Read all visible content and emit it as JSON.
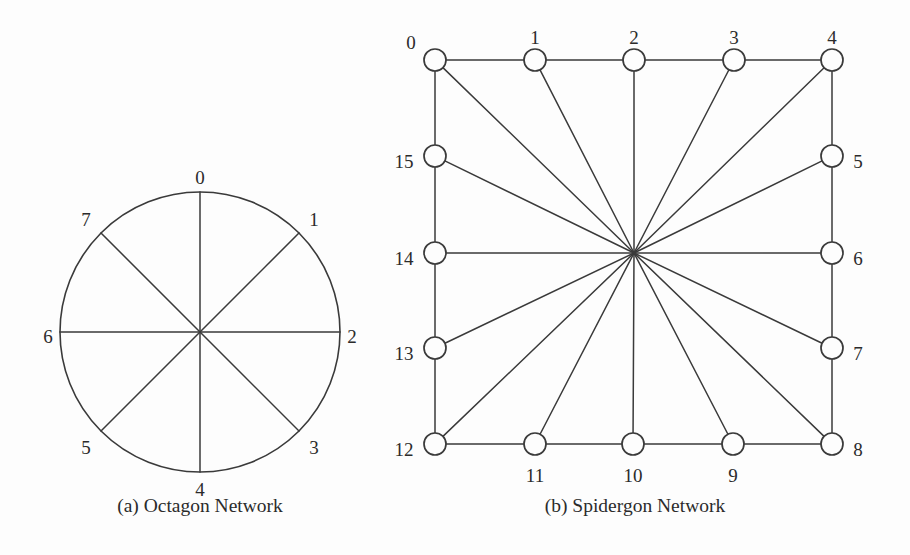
{
  "figure": {
    "background_color": "#fdfdfd",
    "line_color": "#3a3a3a",
    "text_color": "#2b2b2b",
    "panels": [
      {
        "id": "octagon",
        "caption": "(a) Octagon Network",
        "caption_x": 200,
        "caption_y": 512,
        "ring": {
          "cx": 200,
          "cy": 332,
          "r": 140
        },
        "node_count": 8,
        "nodes": [
          {
            "label": "0",
            "angle_deg": 90,
            "x": 200,
            "y": 192,
            "lx": 200,
            "ly": 180,
            "anchor": "middle"
          },
          {
            "label": "1",
            "angle_deg": 45,
            "x": 299,
            "y": 233,
            "lx": 314,
            "ly": 222,
            "anchor": "middle"
          },
          {
            "label": "2",
            "angle_deg": 0,
            "x": 340,
            "y": 332,
            "lx": 352,
            "ly": 339,
            "anchor": "middle"
          },
          {
            "label": "3",
            "angle_deg": -45,
            "x": 299,
            "y": 431,
            "lx": 314,
            "ly": 450,
            "anchor": "middle"
          },
          {
            "label": "4",
            "angle_deg": -90,
            "x": 200,
            "y": 472,
            "lx": 200,
            "ly": 492,
            "anchor": "middle"
          },
          {
            "label": "5",
            "angle_deg": -135,
            "x": 101,
            "y": 431,
            "lx": 86,
            "ly": 450,
            "anchor": "middle"
          },
          {
            "label": "6",
            "angle_deg": 180,
            "x": 60,
            "y": 332,
            "lx": 48,
            "ly": 339,
            "anchor": "middle"
          },
          {
            "label": "7",
            "angle_deg": 135,
            "x": 101,
            "y": 233,
            "lx": 86,
            "ly": 222,
            "anchor": "middle"
          }
        ],
        "diameters": [
          {
            "from": "0",
            "to": "4"
          },
          {
            "from": "1",
            "to": "5"
          },
          {
            "from": "2",
            "to": "6"
          },
          {
            "from": "3",
            "to": "7"
          }
        ]
      },
      {
        "id": "spidergon",
        "caption": "(b) Spidergon Network",
        "caption_x": 635,
        "caption_y": 512,
        "hub": {
          "x": 634,
          "y": 253
        },
        "node_radius": 11,
        "node_count": 16,
        "nodes": [
          {
            "label": "0",
            "x": 435,
            "y": 60,
            "lx": 411,
            "ly": 45,
            "anchor": "middle"
          },
          {
            "label": "1",
            "x": 535,
            "y": 60,
            "lx": 535,
            "ly": 40,
            "anchor": "middle"
          },
          {
            "label": "2",
            "x": 634,
            "y": 60,
            "lx": 634,
            "ly": 40,
            "anchor": "middle"
          },
          {
            "label": "3",
            "x": 734,
            "y": 60,
            "lx": 734,
            "ly": 40,
            "anchor": "middle"
          },
          {
            "label": "4",
            "x": 832,
            "y": 60,
            "lx": 832,
            "ly": 40,
            "anchor": "middle"
          },
          {
            "label": "5",
            "x": 832,
            "y": 156,
            "lx": 858,
            "ly": 164,
            "anchor": "middle"
          },
          {
            "label": "6",
            "x": 832,
            "y": 253,
            "lx": 858,
            "ly": 261,
            "anchor": "middle"
          },
          {
            "label": "7",
            "x": 832,
            "y": 348,
            "lx": 858,
            "ly": 356,
            "anchor": "middle"
          },
          {
            "label": "8",
            "x": 832,
            "y": 444,
            "lx": 858,
            "ly": 452,
            "anchor": "middle"
          },
          {
            "label": "9",
            "x": 733,
            "y": 444,
            "lx": 733,
            "ly": 478,
            "anchor": "middle"
          },
          {
            "label": "10",
            "x": 633,
            "y": 444,
            "lx": 633,
            "ly": 478,
            "anchor": "middle"
          },
          {
            "label": "11",
            "x": 535,
            "y": 444,
            "lx": 535,
            "ly": 478,
            "anchor": "middle"
          },
          {
            "label": "12",
            "x": 435,
            "y": 444,
            "lx": 404,
            "ly": 452,
            "anchor": "middle"
          },
          {
            "label": "13",
            "x": 435,
            "y": 348,
            "lx": 404,
            "ly": 356,
            "anchor": "middle"
          },
          {
            "label": "14",
            "x": 435,
            "y": 253,
            "lx": 404,
            "ly": 261,
            "anchor": "middle"
          },
          {
            "label": "15",
            "x": 435,
            "y": 156,
            "lx": 404,
            "ly": 164,
            "anchor": "middle"
          }
        ],
        "ring_edges": [
          [
            "0",
            "1"
          ],
          [
            "1",
            "2"
          ],
          [
            "2",
            "3"
          ],
          [
            "3",
            "4"
          ],
          [
            "4",
            "5"
          ],
          [
            "5",
            "6"
          ],
          [
            "6",
            "7"
          ],
          [
            "7",
            "8"
          ],
          [
            "8",
            "9"
          ],
          [
            "9",
            "10"
          ],
          [
            "10",
            "11"
          ],
          [
            "11",
            "12"
          ],
          [
            "12",
            "13"
          ],
          [
            "13",
            "14"
          ],
          [
            "14",
            "15"
          ],
          [
            "15",
            "0"
          ]
        ],
        "cross_edges": [
          [
            "0",
            "8"
          ],
          [
            "1",
            "9"
          ],
          [
            "2",
            "10"
          ],
          [
            "3",
            "11"
          ],
          [
            "4",
            "12"
          ],
          [
            "5",
            "13"
          ],
          [
            "6",
            "14"
          ],
          [
            "7",
            "15"
          ]
        ]
      }
    ]
  },
  "chart_data": {
    "type": "diagram",
    "subfigures": [
      {
        "label": "(a) Octagon Network",
        "node_labels": [
          "0",
          "1",
          "2",
          "3",
          "4",
          "5",
          "6",
          "7"
        ],
        "layout": "circle",
        "edges": "8 ring nodes on circle with 4 cross diameters (0-4, 1-5, 2-6, 3-7)"
      },
      {
        "label": "(b) Spidergon Network",
        "node_labels": [
          "0",
          "1",
          "2",
          "3",
          "4",
          "5",
          "6",
          "7",
          "8",
          "9",
          "10",
          "11",
          "12",
          "13",
          "14",
          "15"
        ],
        "layout": "square-ring",
        "edges": "16 ring edges plus 8 cross links through central hub (0-8, 1-9, 2-10, 3-11, 4-12, 5-13, 6-14, 7-15)"
      }
    ]
  }
}
